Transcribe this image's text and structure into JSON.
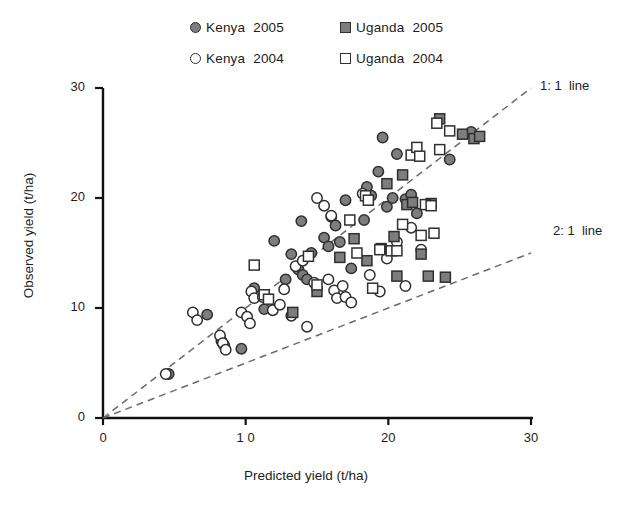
{
  "chart_data": {
    "type": "scatter",
    "title": "",
    "xlabel": "Predicted yield (t/ha)",
    "ylabel": "Observed yield (t/ha)",
    "xlim": [
      0,
      30
    ],
    "ylim": [
      0,
      30
    ],
    "xticks": [
      0,
      10,
      20,
      30
    ],
    "yticks": [
      0,
      10,
      20,
      30
    ],
    "xtick_labels": [
      "0",
      "1 0",
      "20",
      "30"
    ],
    "ytick_labels": [
      "0",
      "10",
      "20",
      "30"
    ],
    "grid": false,
    "legend_position": "top-center",
    "reference_lines": [
      {
        "name": "1:1 line",
        "label": "1: 1  line",
        "slope": 1.0,
        "intercept": 0,
        "style": "dashed"
      },
      {
        "name": "2:1 line",
        "label": "2: 1  line",
        "slope": 0.5,
        "intercept": 0,
        "style": "dashed"
      }
    ],
    "series": [
      {
        "name": "Kenya 2005",
        "marker": "circle-filled",
        "fill": "#7d7d7d",
        "edge": "#2f2f2f",
        "points": [
          [
            4.6,
            4.0
          ],
          [
            7.3,
            9.4
          ],
          [
            8.3,
            7.0
          ],
          [
            8.5,
            6.6
          ],
          [
            9.7,
            6.3
          ],
          [
            10.6,
            11.8
          ],
          [
            11.3,
            9.9
          ],
          [
            12.8,
            12.6
          ],
          [
            13.2,
            14.9
          ],
          [
            13.7,
            13.5
          ],
          [
            14.0,
            13.0
          ],
          [
            14.3,
            12.6
          ],
          [
            14.6,
            15.0
          ],
          [
            15.5,
            16.4
          ],
          [
            16.0,
            18.3
          ],
          [
            16.3,
            17.5
          ],
          [
            17.0,
            19.8
          ],
          [
            17.4,
            13.6
          ],
          [
            18.3,
            18.0
          ],
          [
            18.5,
            21.0
          ],
          [
            18.8,
            20.2
          ],
          [
            19.3,
            22.4
          ],
          [
            19.6,
            25.5
          ],
          [
            19.9,
            19.2
          ],
          [
            20.3,
            20.0
          ],
          [
            20.6,
            24.0
          ],
          [
            21.2,
            19.9
          ],
          [
            21.6,
            20.3
          ],
          [
            22.0,
            18.6
          ],
          [
            24.3,
            23.5
          ],
          [
            25.8,
            26.0
          ],
          [
            12.0,
            16.1
          ],
          [
            15.8,
            15.6
          ],
          [
            16.6,
            16.0
          ],
          [
            13.9,
            17.9
          ]
        ]
      },
      {
        "name": "Kenya 2004",
        "marker": "circle-open",
        "fill": "#ffffff",
        "edge": "#2f2f2f",
        "points": [
          [
            4.4,
            4.0
          ],
          [
            6.3,
            9.6
          ],
          [
            6.6,
            8.9
          ],
          [
            8.2,
            7.5
          ],
          [
            8.4,
            6.8
          ],
          [
            8.6,
            6.2
          ],
          [
            9.7,
            9.6
          ],
          [
            10.1,
            9.2
          ],
          [
            10.3,
            8.6
          ],
          [
            10.4,
            11.5
          ],
          [
            10.6,
            10.9
          ],
          [
            11.9,
            9.8
          ],
          [
            12.4,
            10.3
          ],
          [
            13.2,
            9.3
          ],
          [
            13.5,
            13.8
          ],
          [
            14.0,
            14.3
          ],
          [
            14.3,
            8.3
          ],
          [
            15.0,
            20.0
          ],
          [
            15.5,
            19.3
          ],
          [
            15.8,
            12.6
          ],
          [
            16.0,
            18.4
          ],
          [
            16.2,
            11.6
          ],
          [
            16.4,
            10.9
          ],
          [
            16.8,
            12.0
          ],
          [
            17.0,
            11.0
          ],
          [
            17.4,
            10.5
          ],
          [
            18.2,
            20.4
          ],
          [
            18.7,
            13.0
          ],
          [
            19.4,
            11.5
          ],
          [
            19.9,
            14.5
          ],
          [
            20.6,
            16.0
          ],
          [
            21.2,
            12.0
          ],
          [
            21.6,
            17.3
          ],
          [
            22.3,
            15.3
          ],
          [
            12.7,
            11.7
          ],
          [
            14.8,
            12.3
          ],
          [
            11.2,
            11.0
          ]
        ]
      },
      {
        "name": "Uganda 2005",
        "marker": "square-filled",
        "fill": "#7d7d7d",
        "edge": "#2f2f2f",
        "points": [
          [
            13.3,
            9.6
          ],
          [
            15.0,
            11.5
          ],
          [
            16.6,
            14.6
          ],
          [
            18.5,
            14.3
          ],
          [
            19.5,
            15.4
          ],
          [
            19.9,
            21.3
          ],
          [
            20.4,
            16.5
          ],
          [
            20.6,
            12.9
          ],
          [
            21.0,
            22.1
          ],
          [
            21.3,
            19.4
          ],
          [
            21.7,
            19.6
          ],
          [
            22.3,
            14.9
          ],
          [
            22.8,
            12.9
          ],
          [
            23.0,
            19.5
          ],
          [
            23.6,
            27.2
          ],
          [
            24.0,
            12.8
          ],
          [
            25.2,
            25.8
          ],
          [
            26.0,
            25.4
          ],
          [
            26.4,
            25.6
          ],
          [
            17.6,
            16.3
          ]
        ]
      },
      {
        "name": "Uganda 2004",
        "marker": "square-open",
        "fill": "#ffffff",
        "edge": "#2f2f2f",
        "points": [
          [
            10.6,
            13.9
          ],
          [
            11.3,
            11.2
          ],
          [
            11.6,
            10.8
          ],
          [
            15.0,
            12.1
          ],
          [
            17.3,
            18.0
          ],
          [
            18.4,
            20.2
          ],
          [
            18.6,
            19.8
          ],
          [
            18.9,
            11.8
          ],
          [
            19.4,
            15.3
          ],
          [
            20.2,
            15.2
          ],
          [
            20.6,
            15.2
          ],
          [
            21.0,
            17.6
          ],
          [
            21.6,
            23.9
          ],
          [
            22.0,
            24.6
          ],
          [
            22.2,
            23.8
          ],
          [
            22.3,
            16.6
          ],
          [
            22.6,
            19.4
          ],
          [
            23.0,
            19.3
          ],
          [
            23.2,
            16.8
          ],
          [
            23.4,
            26.8
          ],
          [
            23.6,
            24.4
          ],
          [
            24.3,
            26.1
          ],
          [
            14.4,
            14.7
          ],
          [
            17.8,
            15.0
          ]
        ]
      }
    ]
  },
  "legend": {
    "rows": [
      [
        {
          "marker": "circle-filled",
          "label": "Kenya  2005"
        },
        {
          "marker": "square-filled",
          "label": "Uganda  2005"
        }
      ],
      [
        {
          "marker": "circle-open",
          "label": "Kenya  2004"
        },
        {
          "marker": "square-open",
          "label": "Uganda  2004"
        }
      ]
    ]
  }
}
